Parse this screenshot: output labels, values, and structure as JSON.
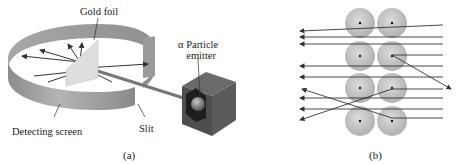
{
  "panel_a": {
    "caption": "(a)",
    "labels": {
      "gold_foil": "Gold foil",
      "alpha_emitter_line1": "α Particle",
      "alpha_emitter_line2": "emitter",
      "detecting_screen": "Detecting screen",
      "slit": "Slit"
    }
  },
  "panel_b": {
    "caption": "(b)",
    "atom_grid": {
      "rows": 4,
      "cols": 2
    },
    "description": "Alpha particles passing through rows of gold atoms; most pass straight, a few deflect or bounce back from nuclei"
  },
  "colors": {
    "screen": "#9a9a9a",
    "foil": "#d8d8d8",
    "box": "#555555",
    "atom": "#c4c4c4",
    "arrow": "#333333"
  }
}
